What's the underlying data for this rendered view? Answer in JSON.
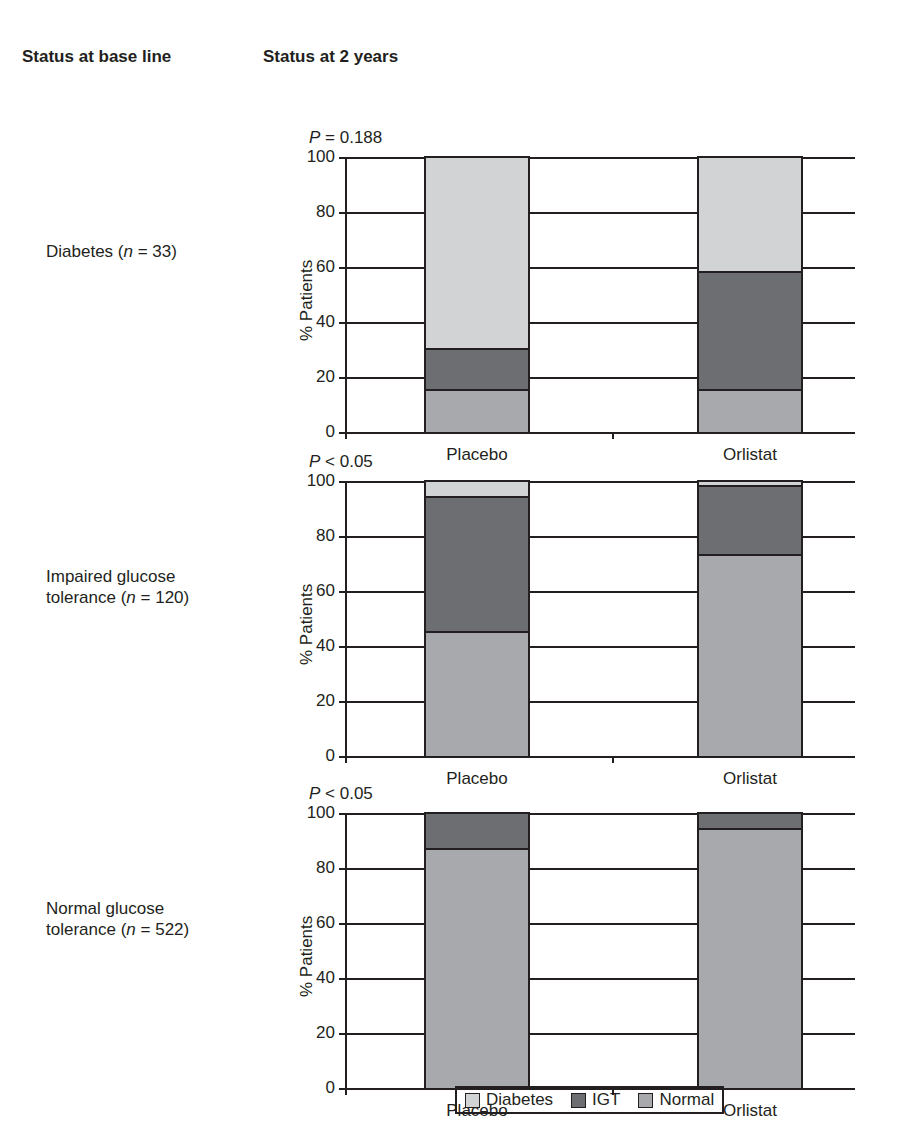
{
  "headers": {
    "baseline": "Status at base line",
    "two_years": "Status at 2 years"
  },
  "legend": [
    {
      "label": "Diabetes",
      "color": "#d1d3d4"
    },
    {
      "label": "IGT",
      "color": "#6d6e71"
    },
    {
      "label": "Normal",
      "color": "#a7a9ac"
    }
  ],
  "panels": [
    {
      "row_label_line1": "Diabetes (",
      "row_label_n": "n",
      "row_label_line1_end": " = 33)",
      "row_label_line2": "",
      "p_prefix": "P",
      "p_rest": " = 0.188",
      "ylabel": "% Patients",
      "yticks": [
        "100",
        "80",
        "60",
        "40",
        "20",
        "0"
      ],
      "xlabels": [
        "Placebo",
        "Orlistat"
      ]
    },
    {
      "row_label_line1": "Impaired glucose",
      "row_label_n": "n",
      "row_label_line2_start": "tolerance (",
      "row_label_line2_end": " = 120)",
      "p_prefix": "P",
      "p_rest": " < 0.05",
      "ylabel": "% Patients",
      "yticks": [
        "100",
        "80",
        "60",
        "40",
        "20",
        "0"
      ],
      "xlabels": [
        "Placebo",
        "Orlistat"
      ]
    },
    {
      "row_label_line1": "Normal glucose",
      "row_label_n": "n",
      "row_label_line2_start": "tolerance (",
      "row_label_line2_end": " = 522)",
      "p_prefix": "P",
      "p_rest": " < 0.05",
      "ylabel": "% Patients",
      "yticks": [
        "100",
        "80",
        "60",
        "40",
        "20",
        "0"
      ],
      "xlabels": [
        "Placebo",
        "Orlistat"
      ]
    }
  ],
  "chart_data": [
    {
      "type": "bar",
      "stacked": true,
      "title": "Diabetes (n = 33)",
      "subtitle": "P = 0.188",
      "categories": [
        "Placebo",
        "Orlistat"
      ],
      "series": [
        {
          "name": "Normal",
          "values": [
            15,
            15
          ]
        },
        {
          "name": "IGT",
          "values": [
            15,
            43
          ]
        },
        {
          "name": "Diabetes",
          "values": [
            70,
            42
          ]
        }
      ],
      "xlabel": "Status at 2 years",
      "ylabel": "% Patients",
      "ylim": [
        0,
        100
      ],
      "yticks": [
        0,
        20,
        40,
        60,
        80,
        100
      ],
      "grid": true,
      "legend_position": "bottom"
    },
    {
      "type": "bar",
      "stacked": true,
      "title": "Impaired glucose tolerance (n = 120)",
      "subtitle": "P < 0.05",
      "categories": [
        "Placebo",
        "Orlistat"
      ],
      "series": [
        {
          "name": "Normal",
          "values": [
            45,
            73
          ]
        },
        {
          "name": "IGT",
          "values": [
            49,
            25
          ]
        },
        {
          "name": "Diabetes",
          "values": [
            6,
            2
          ]
        }
      ],
      "xlabel": "Status at 2 years",
      "ylabel": "% Patients",
      "ylim": [
        0,
        100
      ],
      "yticks": [
        0,
        20,
        40,
        60,
        80,
        100
      ],
      "grid": true,
      "legend_position": "bottom"
    },
    {
      "type": "bar",
      "stacked": true,
      "title": "Normal glucose tolerance (n = 522)",
      "subtitle": "P < 0.05",
      "categories": [
        "Placebo",
        "Orlistat"
      ],
      "series": [
        {
          "name": "Normal",
          "values": [
            87,
            94
          ]
        },
        {
          "name": "IGT",
          "values": [
            13,
            6
          ]
        },
        {
          "name": "Diabetes",
          "values": [
            0,
            0
          ]
        }
      ],
      "xlabel": "Status at 2 years",
      "ylabel": "% Patients",
      "ylim": [
        0,
        100
      ],
      "yticks": [
        0,
        20,
        40,
        60,
        80,
        100
      ],
      "grid": true,
      "legend_position": "bottom"
    }
  ]
}
